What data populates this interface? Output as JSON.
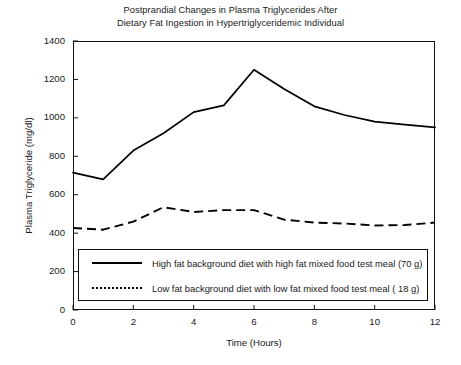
{
  "chart_data": {
    "type": "line",
    "title": "Postprandial Changes in Plasma Triglycerides After Dietary Fat Ingestion in Hypertriglyceridemic Individual",
    "title_line1": "Postprandial Changes in Plasma Triglycerides After",
    "title_line2": "Dietary Fat Ingestion in Hypertriglyceridemic Individual",
    "xlabel": "Time (Hours)",
    "ylabel": "Plasma Triglyceride (mg/dl)",
    "xlim": [
      0,
      12
    ],
    "ylim": [
      0,
      1400
    ],
    "xticks": [
      0,
      2,
      4,
      6,
      8,
      10,
      12
    ],
    "yticks": [
      0,
      200,
      400,
      600,
      800,
      1000,
      1200,
      1400
    ],
    "xtick_labels": [
      "0",
      "2",
      "4",
      "6",
      "8",
      "10",
      "12"
    ],
    "ytick_labels": [
      "0",
      "200",
      "400",
      "600",
      "800",
      "1000",
      "1200",
      "1400"
    ],
    "grid": false,
    "legend_position": "lower center inside",
    "x": [
      0,
      1,
      2,
      3,
      4,
      5,
      6,
      7,
      8,
      9,
      10,
      11,
      12
    ],
    "series": [
      {
        "name": "High fat background diet with high fat mixed food test meal (70 g)",
        "style": "solid",
        "color": "#000000",
        "values": [
          715,
          680,
          830,
          920,
          1030,
          1065,
          1250,
          1150,
          1060,
          1015,
          980,
          965,
          950
        ]
      },
      {
        "name": "Low fat background diet with low fat mixed food test meal ( 18 g)",
        "style": "dotted",
        "color": "#000000",
        "values": [
          427,
          418,
          460,
          535,
          510,
          520,
          520,
          470,
          455,
          450,
          440,
          442,
          455
        ]
      }
    ],
    "legend": [
      {
        "label": "High fat background diet with high fat mixed food test meal (70 g)",
        "style": "solid"
      },
      {
        "label": "Low fat background diet with low fat mixed food test meal ( 18 g)",
        "style": "dotted"
      }
    ]
  }
}
